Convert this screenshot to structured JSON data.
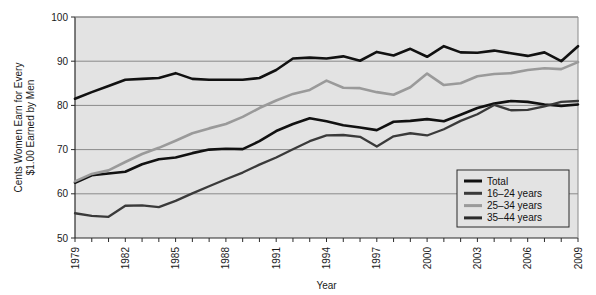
{
  "chart_data": {
    "type": "line",
    "title": "",
    "xlabel": "Year",
    "ylabel": "Cents Women Earn for Every $1.00 Earned by Men",
    "ylabel_line1": "Cents Women Earn for Every",
    "ylabel_line2": "$1.00 Earned by Men",
    "xlim": [
      1979,
      2009
    ],
    "ylim": [
      50,
      100
    ],
    "yticks": [
      50,
      60,
      70,
      80,
      90,
      100
    ],
    "ytick_labels": [
      "50",
      "60",
      "70",
      "80",
      "90",
      "100"
    ],
    "xticks": [
      1979,
      1980,
      1981,
      1982,
      1983,
      1984,
      1985,
      1986,
      1987,
      1988,
      1989,
      1990,
      1991,
      1992,
      1993,
      1994,
      1995,
      1996,
      1997,
      1998,
      1999,
      2000,
      2001,
      2002,
      2003,
      2004,
      2005,
      2006,
      2007,
      2008,
      2009
    ],
    "xtick_labels_shown": [
      "1979",
      "1982",
      "1985",
      "1988",
      "1991",
      "1994",
      "1997",
      "2000",
      "2003",
      "2006",
      "2009"
    ],
    "grid": true,
    "grid_axis": "y",
    "legend_position": "bottom-right",
    "x": [
      1979,
      1980,
      1981,
      1982,
      1983,
      1984,
      1985,
      1986,
      1987,
      1988,
      1989,
      1990,
      1991,
      1992,
      1993,
      1994,
      1995,
      1996,
      1997,
      1998,
      1999,
      2000,
      2001,
      2002,
      2003,
      2004,
      2005,
      2006,
      2007,
      2008,
      2009
    ],
    "series": [
      {
        "name": "Total",
        "color": "#111111",
        "width": 2.6,
        "values": [
          62.5,
          64.2,
          64.6,
          65.0,
          66.7,
          67.8,
          68.2,
          69.2,
          70.0,
          70.2,
          70.1,
          71.9,
          74.2,
          75.8,
          77.1,
          76.4,
          75.5,
          75.0,
          74.4,
          76.3,
          76.5,
          76.9,
          76.4,
          77.9,
          79.4,
          80.4,
          81.0,
          80.8,
          80.2,
          79.9,
          80.2
        ]
      },
      {
        "name": "16–24 years",
        "color": "#3a3a3a",
        "width": 2.3,
        "values": [
          55.6,
          55.0,
          54.8,
          57.3,
          57.4,
          57.0,
          58.4,
          60.1,
          61.7,
          63.3,
          64.8,
          66.6,
          68.2,
          70.1,
          71.9,
          73.2,
          73.3,
          72.9,
          70.7,
          73.0,
          73.7,
          73.2,
          74.6,
          76.5,
          78.0,
          80.1,
          78.9,
          79.0,
          79.8,
          80.8,
          81.0
        ]
      },
      {
        "name": "25–34 years",
        "color": "#9a9a9a",
        "width": 2.6,
        "values": [
          62.8,
          64.5,
          65.3,
          67.2,
          69.0,
          70.4,
          72.0,
          73.7,
          74.8,
          75.8,
          77.4,
          79.4,
          81.1,
          82.6,
          83.5,
          85.6,
          84.0,
          83.9,
          83.0,
          82.4,
          84.1,
          87.2,
          84.6,
          85.0,
          86.6,
          87.1,
          87.3,
          88.0,
          88.4,
          88.2,
          89.8
        ]
      },
      {
        "name": "35–44 years",
        "color": "#111111",
        "width": 2.6,
        "values": [
          81.5,
          83.0,
          84.4,
          85.8,
          86.0,
          86.2,
          87.3,
          86.0,
          85.8,
          85.8,
          85.8,
          86.2,
          88.0,
          90.6,
          90.8,
          90.6,
          91.1,
          90.1,
          92.1,
          91.3,
          92.8,
          91.0,
          93.4,
          92.0,
          91.9,
          92.4,
          91.8,
          91.2,
          92.0,
          90.0,
          93.4
        ]
      }
    ],
    "legend_entries": [
      {
        "label": "Total",
        "color": "#111111"
      },
      {
        "label": "16–24 years",
        "color": "#3a3a3a"
      },
      {
        "label": "25–34 years",
        "color": "#9a9a9a"
      },
      {
        "label": "35–44 years",
        "color": "#2b2b2b"
      }
    ]
  },
  "colors": {
    "plot_background": "#e3e3e3",
    "page_background": "#ffffff",
    "grid": "#8a8a8a",
    "axis": "#2b2b2b",
    "text": "#1a1a1a"
  }
}
